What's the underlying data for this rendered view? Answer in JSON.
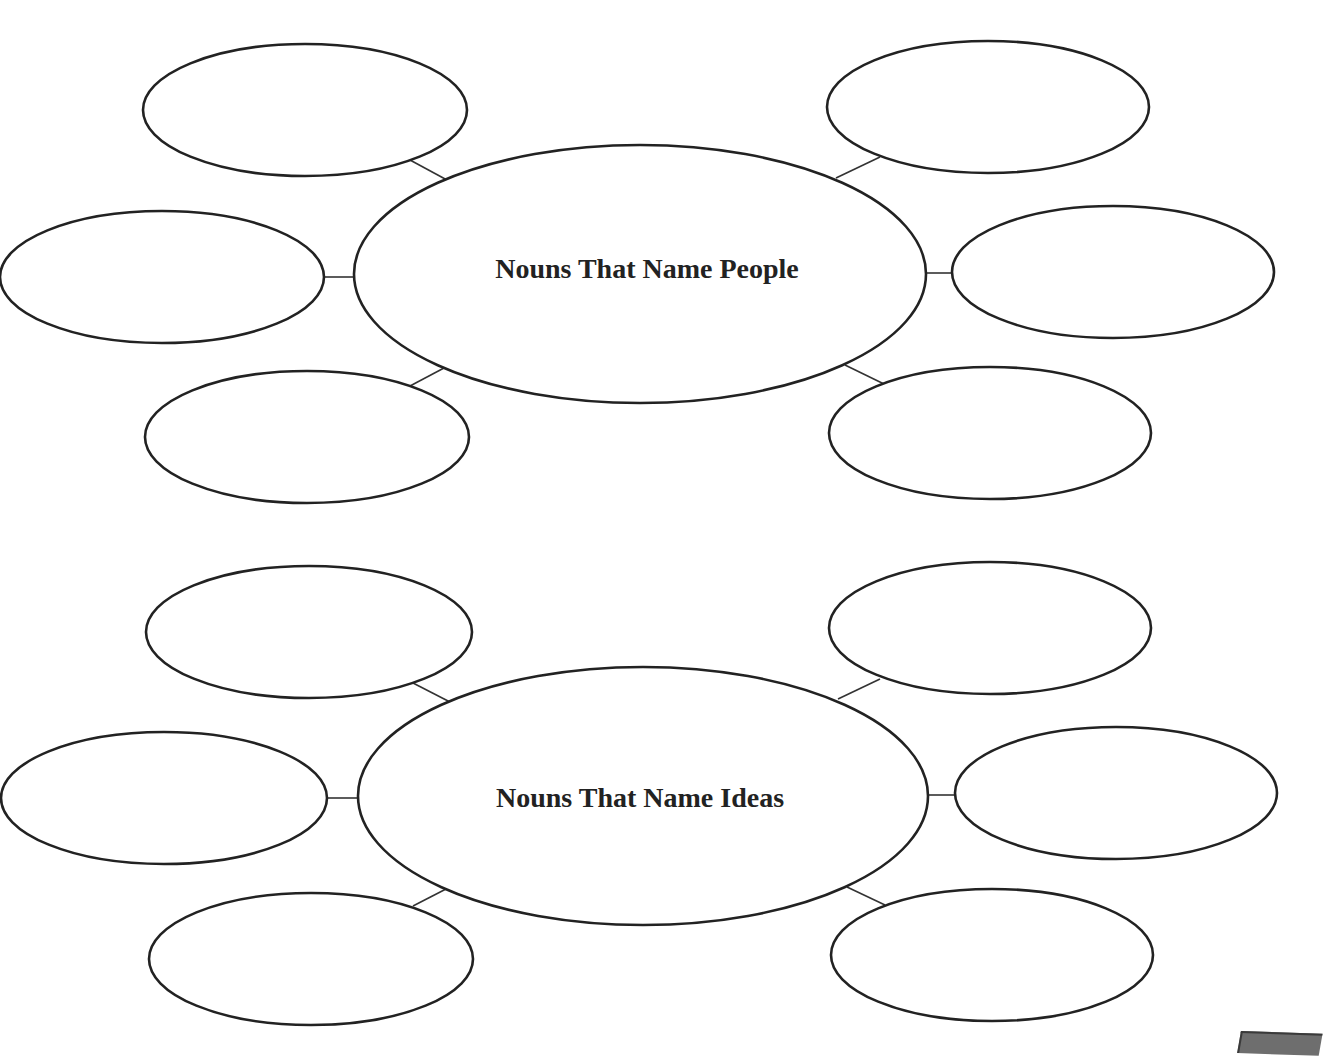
{
  "page": {
    "header_partial_text": "",
    "stroke_color": "#222222",
    "background": "#ffffff"
  },
  "webs": [
    {
      "id": "people",
      "title": "Nouns That Name People",
      "hub": {
        "cx": 640,
        "cy": 274,
        "rx": 286,
        "ry": 129
      },
      "label_pos": {
        "x": 647,
        "y": 278
      },
      "satellites": [
        {
          "position": "top-left",
          "cx": 305,
          "cy": 110,
          "rx": 162,
          "ry": 66,
          "text": ""
        },
        {
          "position": "middle-left",
          "cx": 162,
          "cy": 277,
          "rx": 162,
          "ry": 66,
          "text": ""
        },
        {
          "position": "bottom-left",
          "cx": 307,
          "cy": 437,
          "rx": 162,
          "ry": 66,
          "text": ""
        },
        {
          "position": "top-right",
          "cx": 988,
          "cy": 107,
          "rx": 161,
          "ry": 66,
          "text": ""
        },
        {
          "position": "middle-right",
          "cx": 1113,
          "cy": 272,
          "rx": 161,
          "ry": 66,
          "text": ""
        },
        {
          "position": "bottom-right",
          "cx": 990,
          "cy": 433,
          "rx": 161,
          "ry": 66,
          "text": ""
        }
      ],
      "connectors": [
        {
          "x1": 410,
          "y1": 160,
          "x2": 447,
          "y2": 180
        },
        {
          "x1": 324,
          "y1": 277,
          "x2": 355,
          "y2": 277
        },
        {
          "x1": 410,
          "y1": 386,
          "x2": 444,
          "y2": 368
        },
        {
          "x1": 880,
          "y1": 157,
          "x2": 836,
          "y2": 178
        },
        {
          "x1": 926,
          "y1": 273,
          "x2": 952,
          "y2": 273
        },
        {
          "x1": 845,
          "y1": 365,
          "x2": 884,
          "y2": 384
        }
      ]
    },
    {
      "id": "ideas",
      "title": "Nouns That Name Ideas",
      "hub": {
        "cx": 643,
        "cy": 796,
        "rx": 285,
        "ry": 129
      },
      "label_pos": {
        "x": 640,
        "y": 807
      },
      "satellites": [
        {
          "position": "top-left",
          "cx": 309,
          "cy": 632,
          "rx": 163,
          "ry": 66,
          "text": ""
        },
        {
          "position": "middle-left",
          "cx": 164,
          "cy": 798,
          "rx": 163,
          "ry": 66,
          "text": ""
        },
        {
          "position": "bottom-left",
          "cx": 311,
          "cy": 959,
          "rx": 162,
          "ry": 66,
          "text": ""
        },
        {
          "position": "top-right",
          "cx": 990,
          "cy": 628,
          "rx": 161,
          "ry": 66,
          "text": ""
        },
        {
          "position": "middle-right",
          "cx": 1116,
          "cy": 793,
          "rx": 161,
          "ry": 66,
          "text": ""
        },
        {
          "position": "bottom-right",
          "cx": 992,
          "cy": 955,
          "rx": 161,
          "ry": 66,
          "text": ""
        }
      ],
      "connectors": [
        {
          "x1": 413,
          "y1": 683,
          "x2": 450,
          "y2": 702
        },
        {
          "x1": 327,
          "y1": 798,
          "x2": 358,
          "y2": 798
        },
        {
          "x1": 413,
          "y1": 906,
          "x2": 446,
          "y2": 889
        },
        {
          "x1": 880,
          "y1": 679,
          "x2": 838,
          "y2": 699
        },
        {
          "x1": 928,
          "y1": 795,
          "x2": 955,
          "y2": 795
        },
        {
          "x1": 847,
          "y1": 887,
          "x2": 885,
          "y2": 905
        }
      ]
    }
  ]
}
